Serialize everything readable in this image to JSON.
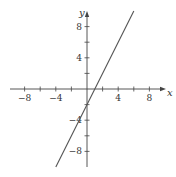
{
  "chart_data": {
    "type": "line",
    "title": "",
    "xlabel": "x",
    "ylabel": "y",
    "xlim": [
      -10,
      10
    ],
    "ylim": [
      -10,
      10
    ],
    "grid": false,
    "legend": null,
    "x_ticks": [
      -8,
      -6,
      -4,
      -2,
      2,
      4,
      6,
      8
    ],
    "x_tick_labels": [
      "−8",
      "−4",
      "4",
      "8"
    ],
    "x_tick_label_values": [
      -8,
      -4,
      4,
      8
    ],
    "y_ticks": [
      -8,
      -6,
      -4,
      -2,
      2,
      4,
      6,
      8
    ],
    "y_tick_labels": [
      "8",
      "4",
      "−4",
      "−8"
    ],
    "y_tick_label_values": [
      8,
      4,
      -4,
      -8
    ],
    "series": [
      {
        "name": "y = 2x − 2",
        "equation": "y = 2x - 2",
        "x": [
          -4,
          6
        ],
        "y": [
          -10,
          10
        ],
        "color": "#555555"
      }
    ]
  }
}
